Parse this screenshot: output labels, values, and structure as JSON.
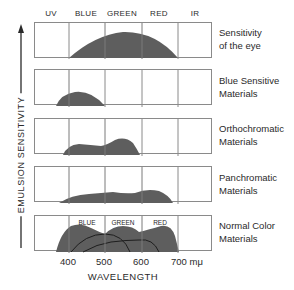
{
  "columns": [
    "UV",
    "BLUE",
    "GREEN",
    "RED",
    "IR"
  ],
  "y_axis_title": "EMULSION SENSITIVITY",
  "x_axis_title": "WAVELENGTH",
  "x_ticks": [
    "400",
    "500",
    "600",
    "700 mμ"
  ],
  "panels": [
    {
      "label_line1": "Sensitivity",
      "label_line2": "of the eye"
    },
    {
      "label_line1": "Blue Sensitive",
      "label_line2": "Materials"
    },
    {
      "label_line1": "Orthochromatic",
      "label_line2": "Materials"
    },
    {
      "label_line1": "Panchromatic",
      "label_line2": "Materials"
    },
    {
      "label_line1": "Normal Color",
      "label_line2": "Materials",
      "inner_labels": [
        "BLUE",
        "GREEN",
        "RED"
      ]
    }
  ],
  "colors": {
    "fill": "#5e5e5e",
    "grid": "#8a8a8a",
    "text": "#2a2a2a"
  }
}
